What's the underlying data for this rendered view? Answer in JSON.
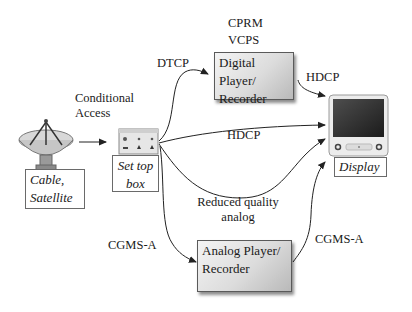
{
  "diagram": {
    "nodes": {
      "source": {
        "label_line1": "Cable,",
        "label_line2": "Satellite",
        "icon": "satellite-dish-icon"
      },
      "settop": {
        "label_line1": "Set top",
        "label_line2": "box",
        "icon": "set-top-box-icon"
      },
      "digital": {
        "label_line1": "Digital Player/",
        "label_line2": "Recorder"
      },
      "analog": {
        "label_line1": "Analog Player/",
        "label_line2": "Recorder"
      },
      "display": {
        "label": "Display",
        "icon": "monitor-icon"
      }
    },
    "edge_labels": {
      "conditional_access_1": "Conditional",
      "conditional_access_2": "Access",
      "dtcp": "DTCP",
      "cprm": "CPRM",
      "vcps": "VCPS",
      "hdcp_top": "HDCP",
      "hdcp_middle": "HDCP",
      "reduced_1": "Reduced quality",
      "reduced_2": "analog",
      "cgms_left": "CGMS-A",
      "cgms_right": "CGMS-A"
    },
    "edges": [
      {
        "from": "source",
        "to": "settop",
        "label": "Conditional Access"
      },
      {
        "from": "settop",
        "to": "digital",
        "label": "DTCP"
      },
      {
        "from": "digital",
        "to": "display",
        "label": "HDCP"
      },
      {
        "from": "settop",
        "to": "display",
        "label": "HDCP"
      },
      {
        "from": "settop",
        "to": "display",
        "label": "Reduced quality analog"
      },
      {
        "from": "settop",
        "to": "analog",
        "label": "CGMS-A"
      },
      {
        "from": "analog",
        "to": "display",
        "label": "CGMS-A"
      }
    ],
    "colors": {
      "line": "#222222",
      "box_border": "#6a6a6a",
      "device_fill_light": "#f4f4f4",
      "device_fill_dark": "#b9b9b9"
    }
  }
}
